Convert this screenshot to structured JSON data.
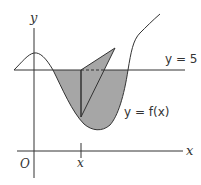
{
  "diagram": {
    "labels": {
      "y_axis": "y",
      "x_axis": "x",
      "origin": "O",
      "x_tick": "x",
      "line_label": "y = 5",
      "curve_label": "y = f(x)"
    },
    "colors": {
      "stroke": "#333333",
      "shade": "#a6a6a6",
      "background": "#ffffff"
    },
    "elements": [
      "y-axis",
      "x-axis",
      "horizontal line y = 5",
      "curve y = f(x)",
      "shaded region between y = 5 and curve",
      "vertical segment at x",
      "triangular cross-section with dashed base"
    ]
  }
}
